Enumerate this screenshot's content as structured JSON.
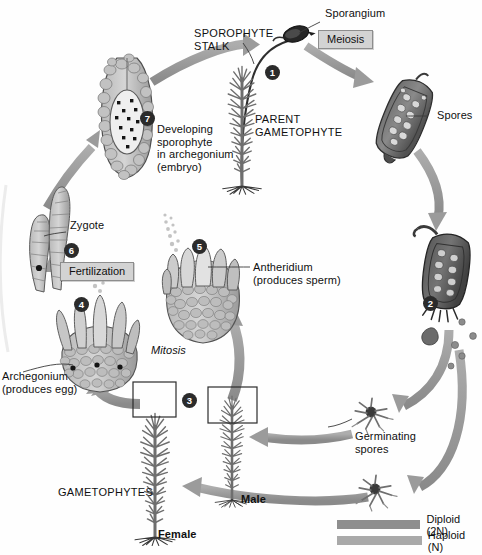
{
  "diagram": {
    "background": "#ffffff"
  },
  "labels": {
    "sporangium": "Sporangium",
    "sporophyte_stalk": "SPOROPHYTE\nSTALK",
    "parent_gametophyte": "PARENT\nGAMETOPHYTE",
    "spores": "Spores",
    "germinating_spores": "Germinating\nspores",
    "male": "Male",
    "female": "Female",
    "gametophytes": "GAMETOPHYTES",
    "antheridium": "Antheridium\n(produces sperm)",
    "archegonium": "Archegonium\n(produces egg)",
    "zygote": "Zygote",
    "developing_sporophyte": "Developing\nsporophyte\nin archegonium\n(embryo)",
    "mitosis": "Mitosis"
  },
  "process_boxes": [
    {
      "id": "meiosis",
      "text": "Meiosis"
    },
    {
      "id": "fertilization",
      "text": "Fertilization"
    }
  ],
  "steps": [
    {
      "n": "1",
      "x": 253,
      "y": 65
    },
    {
      "n": "2",
      "x": 423,
      "y": 296
    },
    {
      "n": "3",
      "x": 182,
      "y": 393
    },
    {
      "n": "4",
      "x": 74,
      "y": 297
    },
    {
      "n": "5",
      "x": 192,
      "y": 239
    },
    {
      "n": "6",
      "x": 64,
      "y": 243
    },
    {
      "n": "7",
      "x": 140,
      "y": 111
    }
  ],
  "legend": {
    "items": [
      {
        "label": "Diploid (2N)",
        "color": "#8e8e8e"
      },
      {
        "label": "Haploid (N)",
        "color": "#a9a9a9"
      }
    ]
  },
  "colors": {
    "arrow": "#9a9a9a",
    "arrow_dark": "#8b8b8b",
    "tissue_light": "#c9c9c9",
    "tissue_mid": "#a8a8a8",
    "tissue_dark": "#6f6f6f",
    "capsule_dark": "#5d5d5d",
    "plant": "#787878",
    "outline": "#3b3b3b",
    "badge": "#2b2b2b",
    "box_fill": "#d3d3d3",
    "box_border": "#8d8d8d"
  }
}
